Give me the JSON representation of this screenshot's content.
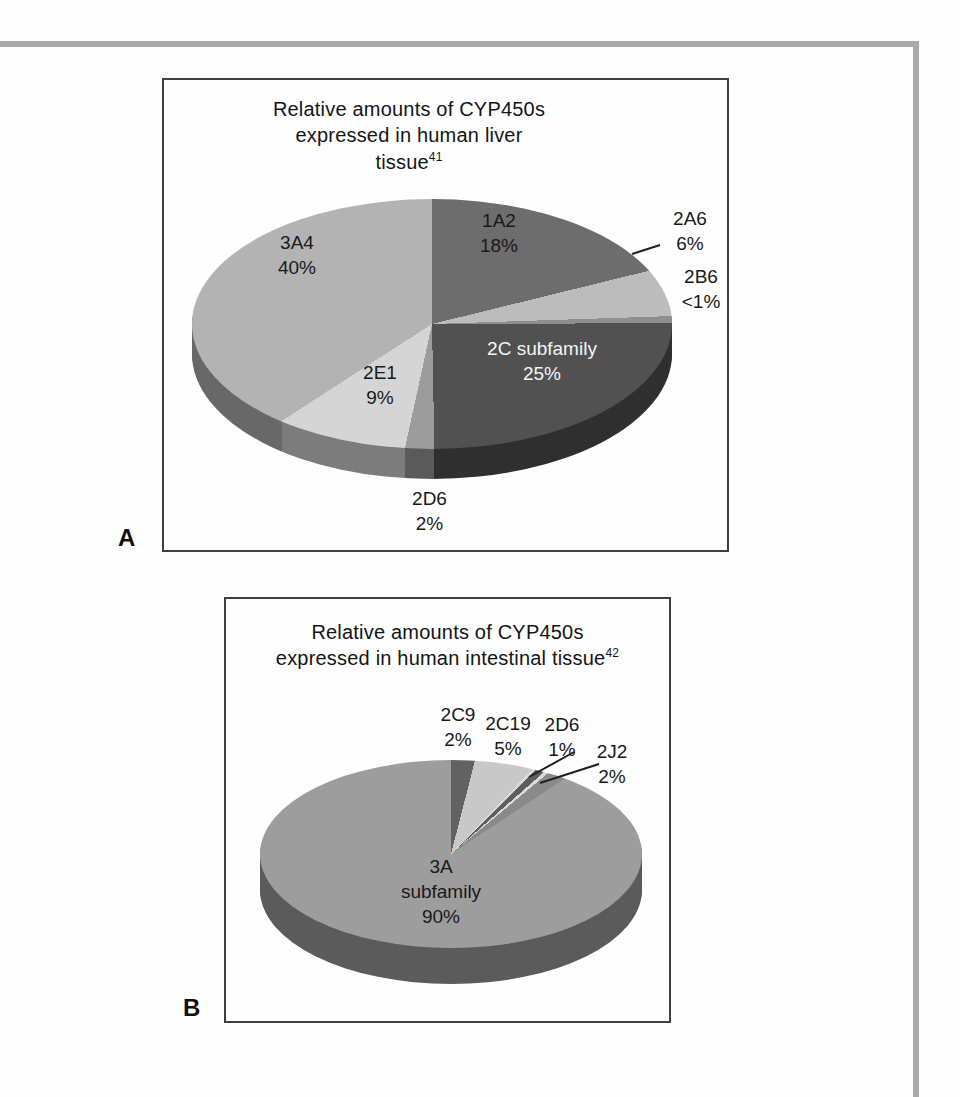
{
  "figure": {
    "panel_a_label": "A",
    "panel_b_label": "B"
  },
  "colors": {
    "frame": "#a9a9a9",
    "box_border": "#3f3f3f",
    "leader_line": "#1f1f1f",
    "side_darken_factor": 0.58
  },
  "chart_data": [
    {
      "type": "pie",
      "panel": "A",
      "title_lines": [
        "Relative amounts of CYP450s",
        "expressed in human liver",
        "tissue"
      ],
      "title_ref": "41",
      "legend_position": "none",
      "labels_on_chart": true,
      "slices": [
        {
          "label": "1A2",
          "value": 18,
          "value_text": "18%",
          "color": "#6d6d6d",
          "display": [
            0,
            76.2
          ]
        },
        {
          "label": "2A6",
          "value": 6,
          "value_text": "6%",
          "color": "#bcbcbc",
          "display": [
            76.2,
            88.1
          ]
        },
        {
          "label": "2B6",
          "value": 1,
          "value_text": "<1%",
          "color": "#8f8f8f",
          "display": [
            88.1,
            89.8
          ]
        },
        {
          "label": "2C subfamily",
          "value": 25,
          "value_text": "25%",
          "color": "#515151",
          "display": [
            89.8,
            178.9
          ]
        },
        {
          "label": "2D6",
          "value": 2,
          "value_text": "2%",
          "color": "#9c9c9c",
          "display": [
            178.9,
            192.3
          ]
        },
        {
          "label": "2E1",
          "value": 9,
          "value_text": "9%",
          "color": "#d5d5d5",
          "display": [
            192.3,
            237.2
          ]
        },
        {
          "label": "3A4",
          "value": 40,
          "value_text": "40%",
          "color": "#b3b3b3",
          "display": [
            237.2,
            360
          ]
        }
      ]
    },
    {
      "type": "pie",
      "panel": "B",
      "title_lines": [
        "Relative amounts of CYP450s",
        "expressed in human intestinal tissue"
      ],
      "title_ref": "42",
      "legend_position": "none",
      "labels_on_chart": true,
      "separator_color": "#d9d9d9",
      "slices": [
        {
          "label": "2C9",
          "value": 2,
          "value_text": "2%",
          "color": "#626262",
          "display": [
            0,
            14.4
          ]
        },
        {
          "label": "2C19",
          "value": 5,
          "value_text": "5%",
          "color": "#c8c8c8",
          "display": [
            14.4,
            43.7
          ]
        },
        {
          "label": "2D6",
          "value": 1,
          "value_text": "1%",
          "color": "#5e5e5e",
          "display": [
            45.2,
            48.6
          ]
        },
        {
          "label": "2J2",
          "value": 2,
          "value_text": "2%",
          "color": "#8a8a8a",
          "display": [
            50.2,
            56.5
          ]
        },
        {
          "label": "3A subfamily",
          "value": 90,
          "value_text": "90%",
          "color": "#9d9d9d",
          "display": [
            56.5,
            360
          ]
        }
      ]
    }
  ]
}
